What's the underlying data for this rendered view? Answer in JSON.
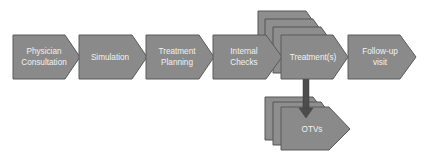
{
  "diagram": {
    "type": "process-flow",
    "steps": [
      {
        "id": "physician",
        "lines": [
          "Physician",
          "Consultation"
        ]
      },
      {
        "id": "simulation",
        "lines": [
          "Simulation"
        ]
      },
      {
        "id": "planning",
        "lines": [
          "Treatment",
          "Planning"
        ]
      },
      {
        "id": "checks",
        "lines": [
          "Internal",
          "Checks"
        ]
      },
      {
        "id": "treatment",
        "lines": [
          "Treatment(s)"
        ],
        "stacked": true,
        "stack_count": 4
      },
      {
        "id": "followup",
        "lines": [
          "Follow-up",
          "visit"
        ]
      }
    ],
    "branch": {
      "from": "treatment",
      "to": {
        "id": "otvs",
        "lines": [
          "OTVs"
        ],
        "stacked": true,
        "stack_count": 3
      },
      "direction": "down"
    },
    "colors": {
      "shape_fill": "#8a8a8a",
      "shape_stroke": "#5a5a5a",
      "text": "#f2f2f2",
      "arrow": "#4d4d4d",
      "background": "#ffffff"
    }
  }
}
